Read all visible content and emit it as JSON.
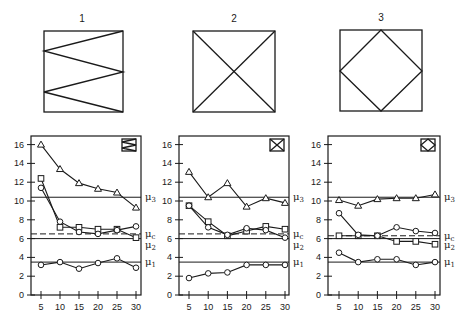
{
  "diagrams": [
    {
      "label": "1",
      "pattern": "zigzag"
    },
    {
      "label": "2",
      "pattern": "x-cross"
    },
    {
      "label": "3",
      "pattern": "diamond"
    }
  ],
  "reference_labels": {
    "mu3": "μ3",
    "muc": "μc",
    "mu2": "μ2",
    "mu1": "μ1"
  },
  "chart_data": [
    {
      "type": "line",
      "title": "1",
      "inset_icon": "zigzag",
      "x": [
        5,
        10,
        15,
        20,
        25,
        30
      ],
      "xticks": [
        "5",
        "10",
        "15",
        "20",
        "25",
        "30"
      ],
      "yticks": [
        "0",
        "2",
        "4",
        "6",
        "8",
        "10",
        "12",
        "14",
        "16"
      ],
      "ylim": [
        0,
        17
      ],
      "xlabel": "",
      "ylabel": "",
      "grid": false,
      "reference_lines": [
        {
          "name": "μ3",
          "value": 10.4,
          "style": "solid"
        },
        {
          "name": "μc",
          "value": 6.5,
          "style": "dashed"
        },
        {
          "name": "μ2",
          "value": 6.0,
          "style": "solid"
        },
        {
          "name": "μ1",
          "value": 3.5,
          "style": "solid"
        }
      ],
      "series": [
        {
          "name": "triangle",
          "marker": "triangle",
          "values": [
            16.0,
            13.4,
            11.9,
            11.3,
            10.9,
            9.3
          ]
        },
        {
          "name": "square",
          "marker": "square",
          "values": [
            12.4,
            7.2,
            7.2,
            7.0,
            7.0,
            6.1
          ]
        },
        {
          "name": "circle-upper",
          "marker": "circle",
          "values": [
            11.4,
            7.8,
            6.7,
            6.5,
            6.9,
            7.3
          ]
        },
        {
          "name": "circle-lower",
          "marker": "circle",
          "values": [
            3.2,
            3.5,
            2.8,
            3.4,
            3.9,
            2.9
          ]
        }
      ]
    },
    {
      "type": "line",
      "title": "2",
      "inset_icon": "x-cross",
      "x": [
        5,
        10,
        15,
        20,
        25,
        30
      ],
      "xticks": [
        "5",
        "10",
        "15",
        "20",
        "25",
        "30"
      ],
      "yticks": [
        "0",
        "2",
        "4",
        "6",
        "8",
        "10",
        "12",
        "14",
        "16"
      ],
      "ylim": [
        0,
        17
      ],
      "xlabel": "",
      "ylabel": "",
      "grid": false,
      "reference_lines": [
        {
          "name": "μ3",
          "value": 10.4,
          "style": "solid"
        },
        {
          "name": "μc",
          "value": 6.5,
          "style": "dashed"
        },
        {
          "name": "μ2",
          "value": 6.0,
          "style": "solid"
        },
        {
          "name": "μ1",
          "value": 3.5,
          "style": "solid"
        }
      ],
      "series": [
        {
          "name": "triangle",
          "marker": "triangle",
          "values": [
            13.1,
            10.4,
            11.9,
            9.4,
            10.3,
            9.8
          ]
        },
        {
          "name": "square",
          "marker": "square",
          "values": [
            9.5,
            7.8,
            6.3,
            6.8,
            7.3,
            7.0
          ]
        },
        {
          "name": "circle-upper",
          "marker": "circle",
          "values": [
            9.5,
            7.2,
            6.4,
            7.1,
            6.9,
            6.1
          ]
        },
        {
          "name": "circle-lower",
          "marker": "circle",
          "values": [
            1.8,
            2.3,
            2.4,
            3.2,
            3.2,
            3.2
          ]
        }
      ]
    },
    {
      "type": "line",
      "title": "3",
      "inset_icon": "diamond",
      "x": [
        5,
        10,
        15,
        20,
        25,
        30
      ],
      "xticks": [
        "5",
        "10",
        "15",
        "20",
        "25",
        "30"
      ],
      "yticks": [
        "0",
        "2",
        "4",
        "6",
        "8",
        "10",
        "12",
        "14",
        "16"
      ],
      "ylim": [
        0,
        17
      ],
      "xlabel": "",
      "ylabel": "",
      "grid": false,
      "reference_lines": [
        {
          "name": "μ3",
          "value": 10.4,
          "style": "solid"
        },
        {
          "name": "μc",
          "value": 6.3,
          "style": "dashed"
        },
        {
          "name": "μ2",
          "value": 6.0,
          "style": "solid"
        },
        {
          "name": "μ1",
          "value": 3.5,
          "style": "solid"
        }
      ],
      "series": [
        {
          "name": "triangle",
          "marker": "triangle",
          "values": [
            10.1,
            9.5,
            10.2,
            10.3,
            10.3,
            10.7
          ]
        },
        {
          "name": "square",
          "marker": "square",
          "values": [
            6.3,
            6.3,
            6.3,
            5.7,
            5.7,
            5.4
          ]
        },
        {
          "name": "circle-upper",
          "marker": "circle",
          "values": [
            8.7,
            6.4,
            6.3,
            7.2,
            6.8,
            6.6
          ]
        },
        {
          "name": "circle-lower",
          "marker": "circle",
          "values": [
            4.5,
            3.5,
            3.8,
            3.8,
            3.2,
            3.5
          ]
        }
      ]
    }
  ]
}
